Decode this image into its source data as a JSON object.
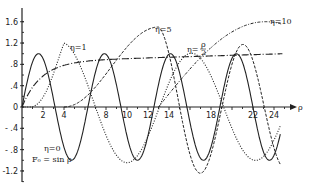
{
  "chart_data": {
    "type": "line",
    "title": "",
    "xlabel": "ρ",
    "ylabel": "",
    "xlim": [
      0,
      25
    ],
    "ylim": [
      -1.4,
      1.7
    ],
    "grid": false,
    "legend": "inline labels",
    "x_ticks": [
      2,
      4,
      6,
      8,
      10,
      12,
      14,
      16,
      18,
      20,
      22,
      24
    ],
    "x_tick_labels": [
      "2",
      "4",
      "8",
      "10",
      "12",
      "14",
      "18",
      "22",
      "24"
    ],
    "y_ticks": [
      1.6,
      1.2,
      0.8,
      0.4,
      0,
      -0.4,
      -0.8,
      -1.2
    ],
    "y_tick_labels": [
      "1.6",
      "1.2",
      ".8",
      ".4",
      "0",
      "- .4",
      "- .8",
      "-1.2"
    ],
    "series": [
      {
        "name": "η=0, F0 = sin ρ",
        "style": "solid",
        "eta": 0
      },
      {
        "name": "η=1",
        "style": "dotted",
        "eta": 1
      },
      {
        "name": "η=5",
        "style": "dashed",
        "eta": 5
      },
      {
        "name": "η=10",
        "style": "dash-dot",
        "eta": 10
      },
      {
        "name": "η=ρ/2",
        "style": "long-dash",
        "eta": "ρ/2"
      }
    ],
    "annotations": {
      "eta0": "η=0",
      "f0": "F₀ = sin ρ",
      "eta1": "η=1",
      "eta5": "η=5",
      "eta10": "η=10",
      "etarho_num": "ρ",
      "etarho_pre": "η=",
      "etarho_den": "2"
    }
  }
}
